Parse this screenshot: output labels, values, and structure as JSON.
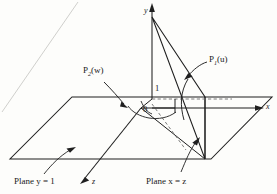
{
  "figure": {
    "background_color": "#fdfdfb",
    "line_color": "#1f1f1f",
    "dashed_color": "#6e6e6e",
    "axes": {
      "x_label": "x",
      "y_label": "y",
      "z_label": "z"
    },
    "ticks": {
      "origin": "0",
      "y_one": "1"
    },
    "points": [
      {
        "name": "P2",
        "base": "P",
        "subscript": "2",
        "argument": "(w)",
        "full_label": "P₂(w)"
      },
      {
        "name": "P1",
        "base": "P",
        "subscript": "1",
        "argument": "(u)",
        "full_label": "P₁(u)"
      }
    ],
    "planes": [
      {
        "name": "horizontal-plane",
        "label_prefix": "Plane ",
        "label_var": "y",
        "label_eq": " = 1",
        "full_label": "Plane y = 1"
      },
      {
        "name": "vertical-plane",
        "label_prefix": "Plane ",
        "label_var": "x",
        "label_eq": " = z",
        "full_label": "Plane x = z"
      }
    ]
  }
}
